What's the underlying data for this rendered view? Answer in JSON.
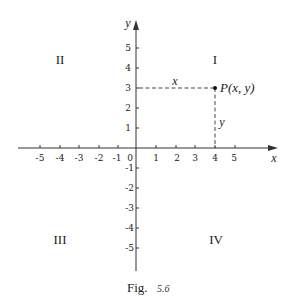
{
  "figure": {
    "caption_label": "Fig.",
    "caption_number": "5.6",
    "axes": {
      "x_label": "x",
      "y_label": "y",
      "origin_label": "0",
      "x_ticks_neg": [
        "-5",
        "-4",
        "-3",
        "-2",
        "-1"
      ],
      "x_ticks_pos": [
        "1",
        "2",
        "3",
        "4",
        "5"
      ],
      "y_ticks_pos": [
        "1",
        "2",
        "3",
        "4",
        "5"
      ],
      "y_ticks_neg": [
        "-1",
        "-2",
        "-3",
        "-4",
        "-5"
      ]
    },
    "quadrants": {
      "q1": "I",
      "q2": "II",
      "q3": "III",
      "q4": "IV"
    },
    "point": {
      "label": "P(x, y)",
      "x": 4,
      "y": 3,
      "horizontal_segment_label": "x",
      "vertical_segment_label": "y"
    }
  }
}
